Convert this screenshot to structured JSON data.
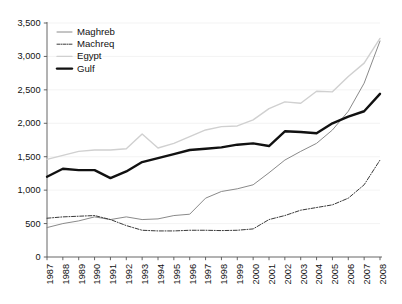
{
  "chart_data": {
    "type": "line",
    "title": "",
    "subtitle": "",
    "xlabel": "",
    "ylabel": "",
    "x": [
      1987,
      1988,
      1989,
      1990,
      1991,
      1992,
      1993,
      1994,
      1995,
      1996,
      1997,
      1998,
      1999,
      2000,
      2001,
      2002,
      2003,
      2004,
      2005,
      2006,
      2007,
      2008
    ],
    "categories": [
      "1987",
      "1988",
      "1989",
      "1990",
      "1991",
      "1992",
      "1993",
      "1994",
      "1995",
      "1996",
      "1997",
      "1998",
      "1999",
      "2000",
      "2001",
      "2002",
      "2003",
      "2004",
      "2005",
      "2006",
      "2007",
      "2008"
    ],
    "xlim": [
      1987,
      2008
    ],
    "ylim": [
      0,
      3500
    ],
    "yticks": [
      0,
      500,
      1000,
      1500,
      2000,
      2500,
      3000,
      3500
    ],
    "ytick_labels": [
      "0",
      "500",
      "1,000",
      "1,500",
      "2,000",
      "2,500",
      "3,000",
      "3,500"
    ],
    "grid": true,
    "legend_position": "top-left",
    "series": [
      {
        "name": "Maghreb",
        "style": "solid-thin-gray",
        "color": "#8a8a8a",
        "width": 1.0,
        "values": [
          440,
          500,
          540,
          600,
          560,
          600,
          560,
          570,
          620,
          640,
          880,
          980,
          1020,
          1080,
          1260,
          1450,
          1580,
          1700,
          1900,
          2180,
          2600,
          3230
        ]
      },
      {
        "name": "Machreq",
        "style": "dash-dot",
        "color": "#3a3a3a",
        "width": 1.0,
        "values": [
          580,
          600,
          610,
          620,
          560,
          470,
          400,
          390,
          390,
          400,
          400,
          395,
          400,
          420,
          560,
          620,
          700,
          740,
          780,
          880,
          1080,
          1450
        ]
      },
      {
        "name": "Egypt",
        "style": "solid-thin-light",
        "color": "#d0d0d0",
        "width": 1.4,
        "values": [
          1460,
          1520,
          1580,
          1600,
          1600,
          1620,
          1840,
          1630,
          1700,
          1800,
          1900,
          1950,
          1960,
          2050,
          2220,
          2320,
          2300,
          2480,
          2470,
          2700,
          2900,
          3270
        ]
      },
      {
        "name": "Gulf",
        "style": "solid-thick-black",
        "color": "#111111",
        "width": 2.4,
        "values": [
          1200,
          1320,
          1300,
          1300,
          1180,
          1280,
          1420,
          1480,
          1540,
          1600,
          1620,
          1640,
          1680,
          1700,
          1660,
          1880,
          1870,
          1850,
          2000,
          2100,
          2180,
          2440
        ]
      }
    ]
  },
  "legend": {
    "items": [
      {
        "label": "Maghreb"
      },
      {
        "label": "Machreq"
      },
      {
        "label": "Egypt"
      },
      {
        "label": "Gulf"
      }
    ]
  }
}
